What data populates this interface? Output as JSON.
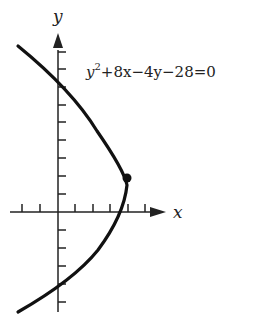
{
  "diagram": {
    "equation": "y²+8x−4y−28=0",
    "equation_parts": {
      "y": "y",
      "sup": "2",
      "rest": "+8x−4y−28=0"
    },
    "x_axis_label": "x",
    "y_axis_label": "y",
    "vertex": {
      "x": 4,
      "y": 2
    },
    "curve_color": "#111111"
  }
}
